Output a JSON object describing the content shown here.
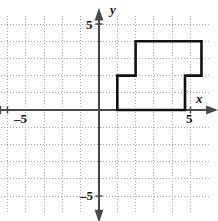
{
  "chart_data": {
    "type": "line",
    "title": "",
    "xlabel": "x",
    "ylabel": "y",
    "xlim": [
      -5.8,
      6.2
    ],
    "ylim": [
      -6.0,
      5.4
    ],
    "grid": true,
    "grid_step": 1,
    "legend": "none",
    "axis_tick_labels": {
      "x_positive": "5",
      "x_negative": "–5",
      "y_positive": "5",
      "y_negative": "–5"
    },
    "axis_arrow_labels": {
      "x": "x",
      "y": "y"
    },
    "series": [
      {
        "name": "polygon",
        "closed": true,
        "stroke": "#111111",
        "fill": "none",
        "points": [
          [
            1,
            0
          ],
          [
            1,
            2
          ],
          [
            2,
            2
          ],
          [
            2,
            4
          ],
          [
            5.6,
            4
          ],
          [
            5.6,
            2
          ],
          [
            4.7,
            2
          ],
          [
            4.7,
            0
          ]
        ]
      }
    ]
  },
  "colors": {
    "axis": "#4a4a4a",
    "grid": "#9a9a9a",
    "shape_stroke": "#111111",
    "background": "#ffffff"
  }
}
